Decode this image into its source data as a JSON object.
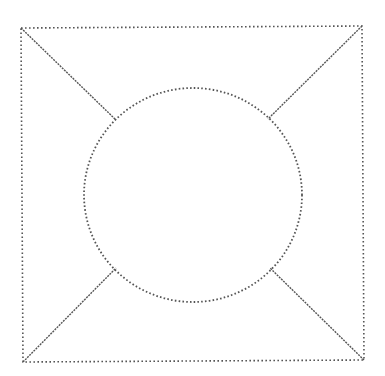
{
  "diagram": {
    "stroke_color": "#555555",
    "background": "#ffffff",
    "square": {
      "corners": {
        "top_left": [
          21,
          28
        ],
        "top_right": [
          362,
          26
        ],
        "bottom_right": [
          364,
          360
        ],
        "bottom_left": [
          23,
          362
        ]
      }
    },
    "circle": {
      "center": [
        193,
        195
      ],
      "rx": 109,
      "ry": 107
    },
    "connectors": [
      {
        "name": "top-left",
        "from": [
          21,
          28
        ],
        "to": [
          116,
          120
        ]
      },
      {
        "name": "top-right",
        "from": [
          362,
          26
        ],
        "to": [
          268,
          119
        ]
      },
      {
        "name": "bottom-left",
        "from": [
          23,
          362
        ],
        "to": [
          116,
          268
        ]
      },
      {
        "name": "bottom-right",
        "from": [
          364,
          360
        ],
        "to": [
          270,
          268
        ]
      }
    ]
  }
}
